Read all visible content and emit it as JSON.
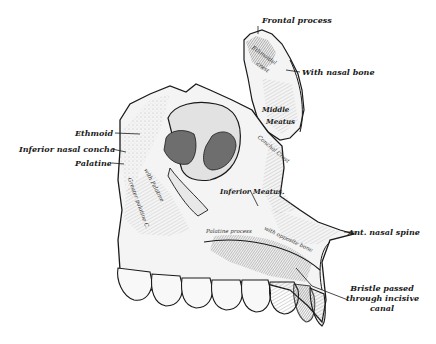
{
  "figure": {
    "colors": {
      "background": "#ffffff",
      "ink": "#1a1a1a",
      "bone_fill": "#f4f4f4",
      "shade_light": "#d9d9d9",
      "shade_mid": "#9a9a9a",
      "shade_dark": "#555555",
      "sinus_fill": "#e2e2e2",
      "sinus_dark": "#6e6e6e"
    }
  },
  "external_labels": {
    "frontal_process": "Frontal process",
    "with_nasal_bone": "With nasal bone",
    "ethmoid": "Ethmoid",
    "inferior_nasal_concha": "Inferior nasal concha",
    "palatine": "Palatine",
    "ant_nasal_spine": "Ant. nasal spine",
    "bristle_line1": "Bristle passed",
    "bristle_line2": "through incisive",
    "bristle_line3": "canal"
  },
  "internal_labels": {
    "ethmoidal_crest_line1": "Ethmoidal",
    "ethmoidal_crest_line2": "crest",
    "middle_line1": "Middle",
    "middle_line2": "Meatus",
    "conchal_crest": "Conchal Crest",
    "inferior_meatus": "Inferior Meatus.",
    "palatine_process": "Palatine process",
    "with_opposite_bone": "with opposite bone",
    "greater_palatine_canal": "Greater palatine C.",
    "with_palatine": "with Palatine"
  }
}
